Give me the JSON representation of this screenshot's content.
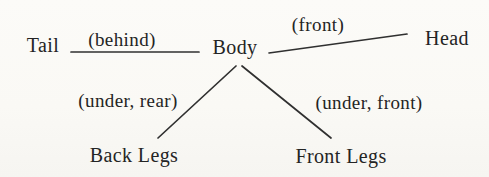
{
  "diagram": {
    "nodes": {
      "tail": {
        "label": "Tail"
      },
      "body": {
        "label": "Body"
      },
      "head": {
        "label": "Head"
      },
      "back_legs": {
        "label": "Back Legs"
      },
      "front_legs": {
        "label": "Front Legs"
      }
    },
    "edge_labels": {
      "behind": "(behind)",
      "front": "(front)",
      "under_rear": "(under, rear)",
      "under_front": "(under, front)"
    },
    "colors": {
      "background": "#fbfaf6",
      "ink": "#242424",
      "line": "#303030"
    }
  }
}
